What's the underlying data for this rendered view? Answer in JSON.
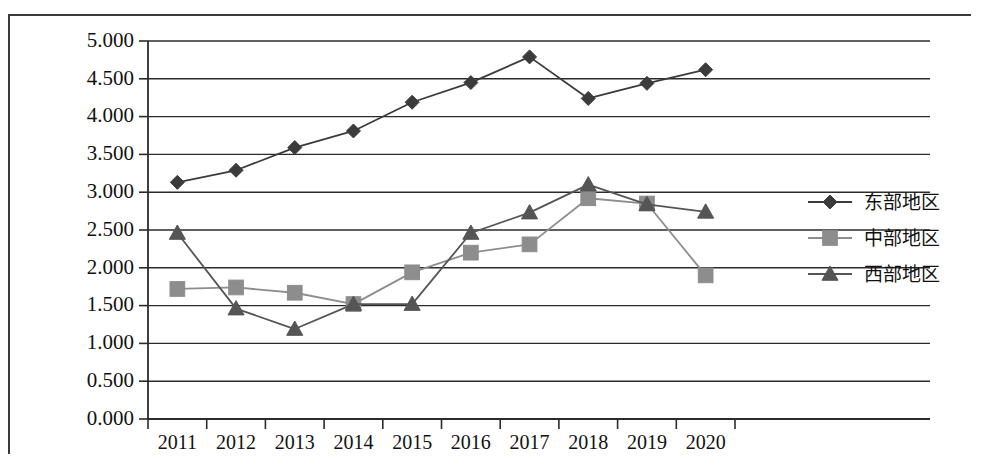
{
  "chart_data": {
    "type": "line",
    "title": "",
    "subtitle": "",
    "xlabel": "",
    "ylabel": "",
    "categories": [
      "2011",
      "2012",
      "2013",
      "2014",
      "2015",
      "2016",
      "2017",
      "2018",
      "2019",
      "2020"
    ],
    "ylim": [
      0,
      5
    ],
    "ytick_labels": [
      "0.000",
      "0.500",
      "1.000",
      "1.500",
      "2.000",
      "2.500",
      "3.000",
      "3.500",
      "4.000",
      "4.500",
      "5.000"
    ],
    "ytick_values": [
      0,
      0.5,
      1,
      1.5,
      2,
      2.5,
      3,
      3.5,
      4,
      4.5,
      5
    ],
    "grid": true,
    "grid_axis": "y",
    "legend_position": "right",
    "series": [
      {
        "name": "东部地区",
        "marker": "diamond",
        "color": "#3b3b3b",
        "values": [
          3.13,
          3.29,
          3.59,
          3.81,
          4.19,
          4.45,
          4.79,
          4.24,
          4.44,
          4.62
        ]
      },
      {
        "name": "中部地区",
        "marker": "square",
        "color": "#8d8d8d",
        "values": [
          1.72,
          1.74,
          1.67,
          1.52,
          1.94,
          2.2,
          2.31,
          2.92,
          2.85,
          1.9
        ]
      },
      {
        "name": "西部地区",
        "marker": "triangle",
        "color": "#555555",
        "values": [
          2.46,
          1.46,
          1.19,
          1.52,
          1.52,
          2.46,
          2.73,
          3.1,
          2.84,
          2.74
        ]
      }
    ]
  },
  "legend": {
    "items": [
      {
        "label": "东部地区",
        "marker": "diamond",
        "color": "#3b3b3b"
      },
      {
        "label": "中部地区",
        "marker": "square",
        "color": "#8d8d8d"
      },
      {
        "label": "西部地区",
        "marker": "triangle",
        "color": "#555555"
      }
    ]
  }
}
